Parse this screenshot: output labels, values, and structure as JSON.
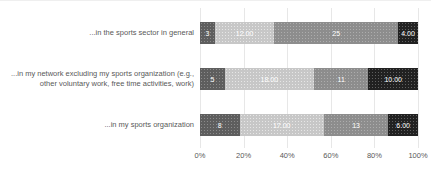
{
  "chart_data": {
    "type": "bar",
    "orientation": "horizontal",
    "stacked": true,
    "title": "",
    "categories": [
      "...in the sports sector in general",
      "...in my network excluding my sports organization (e.g., other voluntary work, free time activities, work)",
      "...in my sports organization"
    ],
    "series": [
      {
        "name": "segment-1-dark-gray",
        "color": "#5e5e5e",
        "values": [
          3,
          5,
          8
        ],
        "labels": [
          "3",
          "5",
          "8"
        ]
      },
      {
        "name": "segment-2-light-gray",
        "color": "#c7c7c7",
        "values": [
          12,
          18,
          17
        ],
        "labels": [
          "12.00",
          "18.00",
          "17.00"
        ]
      },
      {
        "name": "segment-3-mid-gray",
        "color": "#8d8d8d",
        "values": [
          25,
          11,
          13
        ],
        "labels": [
          "25",
          "11",
          "13"
        ]
      },
      {
        "name": "segment-4-black",
        "color": "#212121",
        "values": [
          4,
          10,
          6
        ],
        "labels": [
          "4.00",
          "10.00",
          "6.00"
        ]
      }
    ],
    "stack_total": 44,
    "x_ticks": [
      "0%",
      "20%",
      "40%",
      "60%",
      "80%",
      "100%"
    ],
    "xlim": [
      0,
      100
    ],
    "grid": true,
    "legend_position": "none",
    "value_label_color": "#ffffff",
    "axis_text_color": "#595959",
    "gridline_color": "#e7e7e7"
  }
}
